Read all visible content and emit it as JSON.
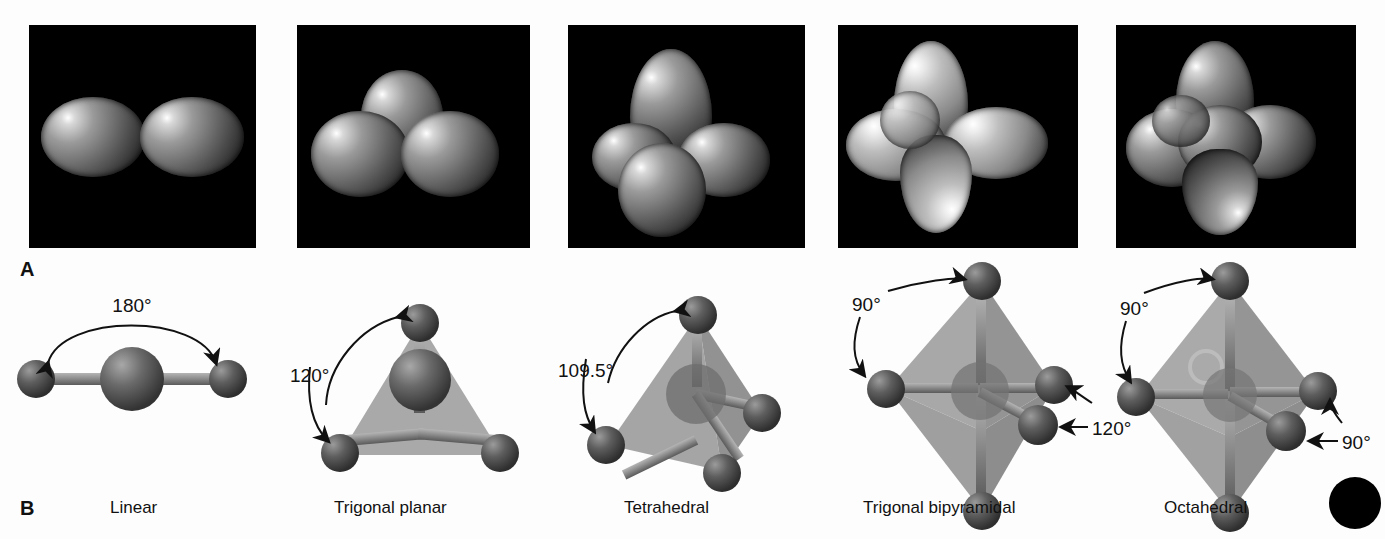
{
  "figure": {
    "panel_letters": {
      "top": "A",
      "bottom": "B"
    },
    "row_a_description": "balloon models on black background",
    "row_b_description": "ball-and-stick molecular geometry models"
  },
  "colors": {
    "background": "#fdfdfd",
    "photo_background": "#000000",
    "atom": "#4a4a4a",
    "bond": "#8a8a8a",
    "polyhedron": "#9d9d9d",
    "text": "#111111",
    "corner_dot": "#000000"
  },
  "shapes": [
    {
      "id": "linear",
      "caption": "Linear",
      "balloon_count": 2,
      "terminal_atoms": 2,
      "angles": [
        "180°"
      ],
      "angle_labels": [
        {
          "text": "180°",
          "arrows": 2
        }
      ]
    },
    {
      "id": "trigonal-planar",
      "caption": "Trigonal planar",
      "balloon_count": 3,
      "terminal_atoms": 3,
      "angles": [
        "120°"
      ],
      "angle_labels": [
        {
          "text": "120°",
          "arrows": 2
        }
      ]
    },
    {
      "id": "tetrahedral",
      "caption": "Tetrahedral",
      "balloon_count": 4,
      "terminal_atoms": 4,
      "angles": [
        "109.5°"
      ],
      "angle_labels": [
        {
          "text": "109.5°",
          "arrows": 2
        }
      ]
    },
    {
      "id": "trigonal-bipyramidal",
      "caption": "Trigonal bipyramidal",
      "balloon_count": 5,
      "terminal_atoms": 5,
      "angles": [
        "90°",
        "120°"
      ],
      "angle_labels": [
        {
          "text": "90°",
          "arrows": 2
        },
        {
          "text": "120°",
          "arrows": 2
        }
      ]
    },
    {
      "id": "octahedral",
      "caption": "Octahedral",
      "balloon_count": 6,
      "terminal_atoms": 6,
      "angles": [
        "90°",
        "90°"
      ],
      "angle_labels": [
        {
          "text": "90°",
          "arrows": 2
        },
        {
          "text": "90°",
          "arrows": 2
        }
      ]
    }
  ],
  "corner_mark": {
    "shape": "filled-circle",
    "color": "#000000"
  }
}
